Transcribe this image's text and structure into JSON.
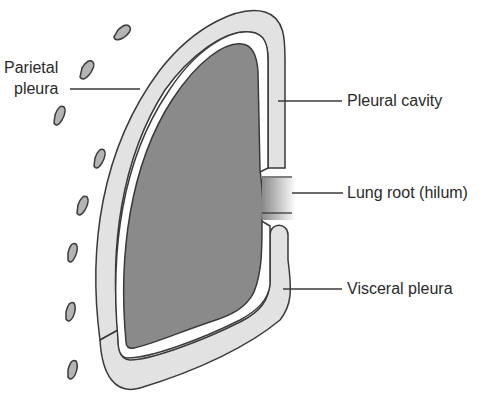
{
  "diagram": {
    "type": "anatomical-diagram",
    "colors": {
      "lung_fill": "#8a8a8a",
      "pleura_fill": "#e2e2e2",
      "cavity_fill": "#ffffff",
      "outline": "#3a3a3a",
      "rib_fill": "#b4b4b4",
      "text": "#2a2a2a"
    },
    "labels": {
      "parietal_line1": "Parietal",
      "parietal_line2": "pleura",
      "pleural_cavity": "Pleural cavity",
      "lung_root": "Lung root (hilum)",
      "visceral_pleura": "Visceral pleura"
    }
  }
}
